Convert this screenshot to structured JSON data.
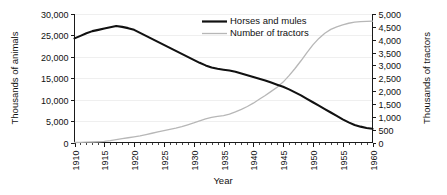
{
  "chart_data": {
    "type": "line",
    "title": "",
    "xlabel": "Year",
    "ylabel": "Thousands of animals",
    "y2label": "Thousands of tractors",
    "xlim": [
      1910,
      1960
    ],
    "ylim": [
      0,
      30000
    ],
    "y2lim": [
      0,
      5000
    ],
    "grid": true,
    "legend_position": "top-center",
    "x_tick_labels": [
      "1910",
      "1915",
      "1920",
      "1925",
      "1930",
      "1935",
      "1940",
      "1945",
      "1950",
      "1955",
      "1960"
    ],
    "x_tick_values": [
      1910,
      1915,
      1920,
      1925,
      1930,
      1935,
      1940,
      1945,
      1950,
      1955,
      1960
    ],
    "x_minor_tick_interval": 1,
    "y_tick_labels": [
      "0",
      "5,000",
      "10,000",
      "15,000",
      "20,000",
      "25,000",
      "30,000"
    ],
    "y_tick_values": [
      0,
      5000,
      10000,
      15000,
      20000,
      25000,
      30000
    ],
    "y2_tick_labels": [
      "0",
      "500",
      "1,000",
      "1,500",
      "2,000",
      "2,500",
      "3,000",
      "3,500",
      "4,000",
      "4,500",
      "5,000"
    ],
    "y2_tick_values": [
      0,
      500,
      1000,
      1500,
      2000,
      2500,
      3000,
      3500,
      4000,
      4500,
      5000
    ],
    "x": [
      1910,
      1911,
      1912,
      1913,
      1914,
      1915,
      1916,
      1917,
      1918,
      1919,
      1920,
      1921,
      1922,
      1923,
      1924,
      1925,
      1926,
      1927,
      1928,
      1929,
      1930,
      1931,
      1932,
      1933,
      1934,
      1935,
      1936,
      1937,
      1938,
      1939,
      1940,
      1941,
      1942,
      1943,
      1944,
      1945,
      1946,
      1947,
      1948,
      1949,
      1950,
      1951,
      1952,
      1953,
      1954,
      1955,
      1956,
      1957,
      1958,
      1959,
      1960
    ],
    "series": [
      {
        "name": "Horses and mules",
        "axis": "left",
        "color": "#111111",
        "unit": "thousands of animals",
        "values": [
          24300,
          24900,
          25500,
          26000,
          26300,
          26600,
          26900,
          27200,
          27000,
          26700,
          26300,
          25600,
          24900,
          24200,
          23500,
          22800,
          22100,
          21400,
          20700,
          20000,
          19300,
          18600,
          18000,
          17500,
          17200,
          17000,
          16800,
          16500,
          16100,
          15700,
          15300,
          14900,
          14500,
          14000,
          13500,
          13000,
          12400,
          11700,
          11000,
          10200,
          9400,
          8600,
          7800,
          7000,
          6200,
          5400,
          4700,
          4100,
          3700,
          3400,
          3200
        ]
      },
      {
        "name": "Number of tractors",
        "axis": "right",
        "color": "#b7b7b7",
        "unit": "thousands of tractors",
        "values": [
          0,
          5,
          12,
          20,
          30,
          45,
          70,
          110,
          150,
          185,
          220,
          260,
          310,
          360,
          410,
          460,
          510,
          560,
          620,
          690,
          760,
          840,
          920,
          980,
          1020,
          1050,
          1100,
          1190,
          1290,
          1400,
          1530,
          1680,
          1830,
          1990,
          2150,
          2350,
          2600,
          2880,
          3180,
          3500,
          3800,
          4050,
          4250,
          4400,
          4500,
          4580,
          4640,
          4680,
          4700,
          4710,
          4720
        ]
      }
    ],
    "annotations": {
      "crossover_note": "Tractor count overtakes horses and mules scale near 1944-1945",
      "horses_peak_year": 1917,
      "horses_peak_value": 27200,
      "tractors_final_value": 4720
    }
  },
  "legend": {
    "items": [
      {
        "label": "Horses and mules",
        "color": "#111111"
      },
      {
        "label": "Number of tractors",
        "color": "#b7b7b7"
      }
    ]
  }
}
